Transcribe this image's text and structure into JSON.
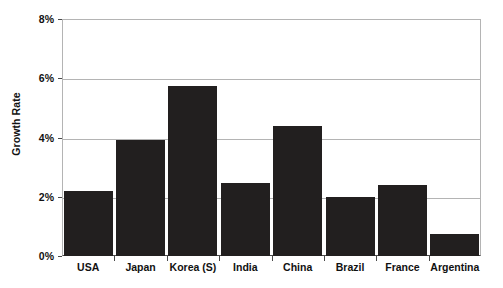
{
  "chart_data": {
    "type": "bar",
    "title": "",
    "xlabel": "",
    "ylabel": "Growth Rate",
    "categories": [
      "USA",
      "Japan",
      "Korea (S)",
      "India",
      "China",
      "Brazil",
      "France",
      "Argentina"
    ],
    "values": [
      2.2,
      3.9,
      5.75,
      2.45,
      4.4,
      2.0,
      2.4,
      0.75
    ],
    "value_unit": "%",
    "ylim": [
      0,
      8
    ],
    "ytick_labels": [
      "0%",
      "2%",
      "4%",
      "6%",
      "8%"
    ],
    "ytick_values": [
      0,
      2,
      4,
      6,
      8
    ],
    "grid": "horizontal",
    "legend": "none",
    "bar_color": "#221f1f"
  }
}
